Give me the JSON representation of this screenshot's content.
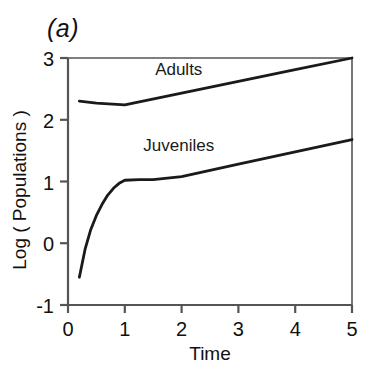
{
  "figure": {
    "panel_label": "(a)",
    "background_color": "#ffffff",
    "line_color": "#1a1a1a",
    "axis_color": "#555555"
  },
  "chart_data": {
    "type": "line",
    "title": "",
    "panel": "(a)",
    "xlabel": "Time",
    "ylabel": "Log ( Populations )",
    "xlim": [
      0,
      5
    ],
    "ylim": [
      -1,
      3
    ],
    "xticks": [
      0,
      1,
      2,
      3,
      4,
      5
    ],
    "xtick_labels": [
      "0",
      "1",
      "2",
      "3",
      "4",
      "5"
    ],
    "yticks": [
      -1,
      0,
      1,
      2,
      3
    ],
    "ytick_labels": [
      "-1",
      "0",
      "1",
      "2",
      "3"
    ],
    "grid": false,
    "legend": "inline-annotations",
    "legend_position": "inside-above-each-curve",
    "series": [
      {
        "name": "Adults",
        "label_text": "Adults",
        "label_x": 1.95,
        "label_y": 2.72,
        "color": "#1a1a1a",
        "x": [
          0.2,
          0.5,
          1.0,
          2.0,
          3.0,
          4.0,
          5.0
        ],
        "y": [
          2.3,
          2.27,
          2.24,
          2.43,
          2.62,
          2.81,
          3.0
        ]
      },
      {
        "name": "Juveniles",
        "label_text": "Juveniles",
        "label_x": 1.95,
        "label_y": 1.5,
        "color": "#1a1a1a",
        "x": [
          0.2,
          0.3,
          0.4,
          0.5,
          0.6,
          0.7,
          0.8,
          0.9,
          1.0,
          1.25,
          1.5,
          2.0,
          3.0,
          4.0,
          5.0
        ],
        "y": [
          -0.55,
          -0.1,
          0.22,
          0.45,
          0.63,
          0.78,
          0.89,
          0.97,
          1.02,
          1.03,
          1.03,
          1.08,
          1.28,
          1.48,
          1.68
        ]
      }
    ]
  }
}
